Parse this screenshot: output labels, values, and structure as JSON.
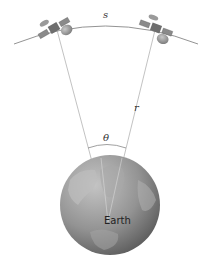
{
  "diagram": {
    "labels": {
      "arc": "s",
      "radius": "r",
      "angle": "θ",
      "planet": "Earth"
    },
    "colors": {
      "line": "#a0a0a0",
      "earth_light": "#b8b8b8",
      "earth_dark": "#6a6a6a",
      "satellite_body": "#6e6e6e",
      "satellite_panel": "#8c8c8c"
    },
    "elements": {
      "satellites": [
        {
          "name": "satellite-left"
        },
        {
          "name": "satellite-right"
        }
      ]
    }
  }
}
